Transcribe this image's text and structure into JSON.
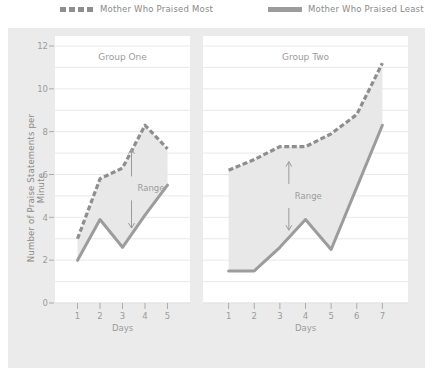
{
  "legend": {
    "items": [
      {
        "label": "Mother Who  Praised Most",
        "style": "dashed",
        "icon": "dashed-line-swatch"
      },
      {
        "label": "Mother Who  Praised Least",
        "style": "solid",
        "icon": "solid-line-swatch"
      }
    ]
  },
  "axes": {
    "ylabel": "Number of Praise Statements per Minute",
    "yticks": [
      "0",
      "2",
      "4",
      "6",
      "8",
      "10",
      "12"
    ],
    "xlabel": "Days"
  },
  "colors": {
    "background": "#ebebeb",
    "panel": "#ffffff",
    "line_most": "#8e8e8e",
    "line_least": "#9c9c9c",
    "band_fill": "#e8e8e8",
    "grid": "#e3e3e3",
    "text": "#9b9b9b"
  },
  "annotations": {
    "range_label": "Range"
  },
  "chart_data": {
    "type": "line",
    "title": "",
    "xlabel": "Days",
    "ylabel": "Number of Praise Statements per Minute",
    "ylim": [
      0,
      12
    ],
    "yticks": [
      0,
      2,
      4,
      6,
      8,
      10,
      12
    ],
    "grid": true,
    "legend_position": "top",
    "panels": [
      {
        "title": "Group One",
        "x": [
          1,
          2,
          3,
          4,
          5
        ],
        "xticks": [
          "1",
          "2",
          "3",
          "4",
          "5"
        ],
        "series": [
          {
            "name": "Mother Who Praised Most",
            "style": "dashed",
            "values": [
              3.0,
              5.8,
              6.3,
              8.3,
              7.2
            ]
          },
          {
            "name": "Mother Who Praised Least",
            "style": "solid",
            "values": [
              2.0,
              3.9,
              2.6,
              4.1,
              5.5
            ]
          }
        ],
        "range_annotation": {
          "label": "Range",
          "x": 3.4,
          "y_top": 7.2,
          "y_bottom": 3.5
        }
      },
      {
        "title": "Group Two",
        "x": [
          1,
          2,
          3,
          4,
          5,
          6,
          7
        ],
        "xticks": [
          "1",
          "2",
          "3",
          "4",
          "5",
          "6",
          "7"
        ],
        "series": [
          {
            "name": "Mother Who Praised Most",
            "style": "dashed",
            "values": [
              6.2,
              6.7,
              7.3,
              7.3,
              7.9,
              8.8,
              11.2
            ]
          },
          {
            "name": "Mother Who Praised Least",
            "style": "solid",
            "values": [
              1.5,
              1.5,
              2.6,
              3.9,
              2.5,
              5.4,
              8.3
            ]
          }
        ],
        "range_annotation": {
          "label": "Range",
          "x": 3.35,
          "y_top": 6.6,
          "y_bottom": 3.4
        }
      }
    ]
  }
}
